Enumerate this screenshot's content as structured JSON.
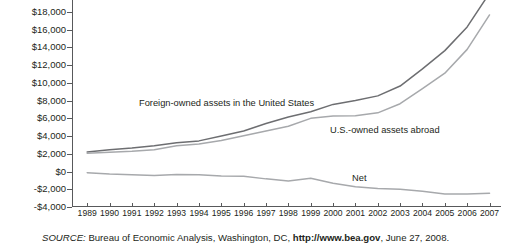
{
  "figure": {
    "source_keyword": "SOURCE:",
    "source_text": " Bureau of Economic Analysis, Washington, DC, ",
    "source_url": "http://www.bea.gov",
    "source_date": ", June 27, 2008."
  },
  "annotations": {
    "foreign": "Foreign-owned assets in the United States",
    "us_owned": "U.S.-owned assets abroad",
    "net": "Net"
  },
  "colors": {
    "foreign_line": "#6d6e71",
    "us_owned_line": "#a7a9ac",
    "net_line": "#a7a9ac",
    "axis": "#58595b",
    "text": "#231f20"
  },
  "chart_data": {
    "type": "line",
    "title": "",
    "subtitle": "",
    "xlabel": "",
    "ylabel": "",
    "grid": false,
    "legend_position": "inline-annotations",
    "ylim": [
      -4000,
      20000
    ],
    "ytick_step": 2000,
    "ytick_labels": [
      "$20,000",
      "$18,000",
      "$16,000",
      "$14,000",
      "$12,000",
      "$10,000",
      "$8,000",
      "$6,000",
      "$4,000",
      "$2,000",
      "$0",
      "-$2,000",
      "-$4,000"
    ],
    "ytick_values": [
      20000,
      18000,
      16000,
      14000,
      12000,
      10000,
      8000,
      6000,
      4000,
      2000,
      0,
      -2000,
      -4000
    ],
    "ytop_label_clipped": true,
    "x": [
      1989,
      1990,
      1991,
      1992,
      1993,
      1994,
      1995,
      1996,
      1997,
      1998,
      1999,
      2000,
      2001,
      2002,
      2003,
      2004,
      2005,
      2006,
      2007
    ],
    "xtick_labels": [
      "1989",
      "1990",
      "1991",
      "1992",
      "1993",
      "1994",
      "1995",
      "1996",
      "1997",
      "1998",
      "1999",
      "2000",
      "2001",
      "2002",
      "2003",
      "2004",
      "2005",
      "2006",
      "2007"
    ],
    "series": [
      {
        "name": "Foreign-owned assets in the United States",
        "color": "#6d6e71",
        "values": [
          2200,
          2460,
          2650,
          2900,
          3240,
          3450,
          4000,
          4560,
          5400,
          6150,
          6740,
          7560,
          8000,
          8520,
          9630,
          11560,
          13620,
          16290,
          20100
        ]
      },
      {
        "name": "U.S.-owned assets abroad",
        "color": "#a7a9ac",
        "values": [
          2070,
          2180,
          2290,
          2460,
          2900,
          3090,
          3490,
          4030,
          4570,
          5090,
          5990,
          6240,
          6270,
          6610,
          7640,
          9340,
          11080,
          13760,
          17640
        ]
      },
      {
        "name": "Net",
        "color": "#a7a9ac",
        "values": [
          -130,
          -280,
          -360,
          -440,
          -340,
          -360,
          -510,
          -530,
          -830,
          -1060,
          -750,
          -1320,
          -1730,
          -1910,
          -1990,
          -2220,
          -2540,
          -2530,
          -2460
        ]
      }
    ]
  }
}
